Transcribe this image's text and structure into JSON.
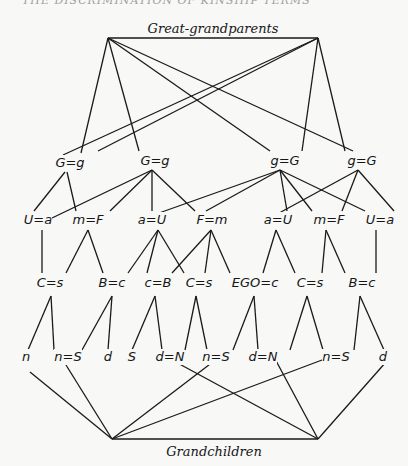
{
  "header_fragment": "THE DISCRIMINATION OF KINSHIP TERMS",
  "top_label": "Great-grandparents",
  "bottom_label": "Grandchildren",
  "rows": {
    "grandparents": [
      {
        "id": "g1",
        "label": "G=g",
        "x": 70,
        "y": 167
      },
      {
        "id": "g2",
        "label": "G=g",
        "x": 155,
        "y": 165
      },
      {
        "id": "g3",
        "label": "g=G",
        "x": 285,
        "y": 165
      },
      {
        "id": "g4",
        "label": "g=G",
        "x": 362,
        "y": 165
      }
    ],
    "parents": [
      {
        "id": "p1",
        "label": "U=a",
        "x": 38,
        "y": 224
      },
      {
        "id": "p2",
        "label": "m=F",
        "x": 88,
        "y": 224
      },
      {
        "id": "p3",
        "label": "a=U",
        "x": 152,
        "y": 224
      },
      {
        "id": "p4",
        "label": "F=m",
        "x": 212,
        "y": 224
      },
      {
        "id": "p5",
        "label": "a=U",
        "x": 278,
        "y": 224
      },
      {
        "id": "p6",
        "label": "m=F",
        "x": 329,
        "y": 224
      },
      {
        "id": "p7",
        "label": "U=a",
        "x": 380,
        "y": 224
      }
    ],
    "ego_generation": [
      {
        "id": "e1",
        "label": "C=s",
        "x": 50,
        "y": 287
      },
      {
        "id": "e2",
        "label": "B=c",
        "x": 112,
        "y": 287
      },
      {
        "id": "e3",
        "label": "c=B",
        "x": 158,
        "y": 287
      },
      {
        "id": "e4",
        "label": "C=s",
        "x": 199,
        "y": 287
      },
      {
        "id": "e5",
        "label": "EGO=c",
        "x": 255,
        "y": 287
      },
      {
        "id": "e6",
        "label": "C=s",
        "x": 310,
        "y": 287
      },
      {
        "id": "e7",
        "label": "B=c",
        "x": 362,
        "y": 287
      }
    ],
    "children": [
      {
        "id": "c1",
        "label": "n",
        "x": 26,
        "y": 361
      },
      {
        "id": "c2",
        "label": "n=S",
        "x": 68,
        "y": 361
      },
      {
        "id": "c3",
        "label": "d",
        "x": 108,
        "y": 361
      },
      {
        "id": "c4",
        "label": "S",
        "x": 132,
        "y": 361
      },
      {
        "id": "c5",
        "label": "d=N",
        "x": 170,
        "y": 361
      },
      {
        "id": "c6",
        "label": "n=S",
        "x": 216,
        "y": 361
      },
      {
        "id": "c7",
        "label": "d=N",
        "x": 263,
        "y": 361
      },
      {
        "id": "c8",
        "label": "n=S",
        "x": 336,
        "y": 361
      },
      {
        "id": "c9",
        "label": "d",
        "x": 383,
        "y": 361
      }
    ]
  },
  "edges": {
    "top_left_apex": [
      108,
      38
    ],
    "top_right_apex": [
      318,
      38
    ],
    "bottom_left_apex": [
      112,
      439
    ],
    "bottom_right_apex": [
      318,
      439
    ],
    "top_left_to": [
      [
        81,
        153
      ],
      [
        139,
        151
      ],
      [
        270,
        151
      ],
      [
        353,
        151
      ]
    ],
    "top_right_to": [
      [
        63,
        155
      ],
      [
        98,
        151
      ],
      [
        302,
        151
      ],
      [
        345,
        151
      ]
    ],
    "g_to_p": [
      [
        [
          65,
          172
        ],
        [
          34,
          211
        ]
      ],
      [
        [
          67,
          172
        ],
        [
          76,
          211
        ]
      ],
      [
        [
          152,
          170
        ],
        [
          52,
          218
        ]
      ],
      [
        [
          152,
          170
        ],
        [
          110,
          211
        ]
      ],
      [
        [
          152,
          170
        ],
        [
          152,
          211
        ]
      ],
      [
        [
          152,
          170
        ],
        [
          195,
          211
        ]
      ],
      [
        [
          280,
          170
        ],
        [
          145,
          218
        ]
      ],
      [
        [
          280,
          170
        ],
        [
          206,
          211
        ]
      ],
      [
        [
          280,
          170
        ],
        [
          287,
          211
        ]
      ],
      [
        [
          280,
          170
        ],
        [
          312,
          211
        ]
      ],
      [
        [
          280,
          170
        ],
        [
          365,
          211
        ]
      ],
      [
        [
          358,
          170
        ],
        [
          270,
          218
        ]
      ],
      [
        [
          358,
          170
        ],
        [
          342,
          211
        ]
      ],
      [
        [
          358,
          170
        ],
        [
          394,
          211
        ]
      ]
    ],
    "p_to_e": [
      [
        [
          42,
          230
        ],
        [
          42,
          273
        ]
      ],
      [
        [
          88,
          230
        ],
        [
          66,
          273
        ]
      ],
      [
        [
          88,
          230
        ],
        [
          103,
          273
        ]
      ],
      [
        [
          158,
          230
        ],
        [
          128,
          273
        ]
      ],
      [
        [
          158,
          230
        ],
        [
          147,
          273
        ]
      ],
      [
        [
          158,
          230
        ],
        [
          184,
          273
        ]
      ],
      [
        [
          211,
          230
        ],
        [
          172,
          273
        ]
      ],
      [
        [
          211,
          230
        ],
        [
          205,
          273
        ]
      ],
      [
        [
          211,
          230
        ],
        [
          230,
          273
        ]
      ],
      [
        [
          276,
          230
        ],
        [
          263,
          273
        ]
      ],
      [
        [
          276,
          230
        ],
        [
          295,
          273
        ]
      ],
      [
        [
          326,
          230
        ],
        [
          322,
          273
        ]
      ],
      [
        [
          326,
          230
        ],
        [
          345,
          273
        ]
      ],
      [
        [
          376,
          230
        ],
        [
          376,
          273
        ]
      ]
    ],
    "e_to_c": [
      [
        [
          51,
          296
        ],
        [
          28,
          350
        ]
      ],
      [
        [
          51,
          296
        ],
        [
          54,
          350
        ]
      ],
      [
        [
          112,
          296
        ],
        [
          82,
          350
        ]
      ],
      [
        [
          112,
          296
        ],
        [
          108,
          350
        ]
      ],
      [
        [
          155,
          296
        ],
        [
          132,
          350
        ]
      ],
      [
        [
          155,
          296
        ],
        [
          162,
          350
        ]
      ],
      [
        [
          196,
          296
        ],
        [
          185,
          350
        ]
      ],
      [
        [
          196,
          296
        ],
        [
          207,
          350
        ]
      ],
      [
        [
          254,
          296
        ],
        [
          233,
          350
        ]
      ],
      [
        [
          254,
          296
        ],
        [
          258,
          350
        ]
      ],
      [
        [
          307,
          296
        ],
        [
          290,
          350
        ]
      ],
      [
        [
          307,
          296
        ],
        [
          323,
          350
        ]
      ],
      [
        [
          360,
          296
        ],
        [
          354,
          350
        ]
      ],
      [
        [
          360,
          296
        ],
        [
          384,
          350
        ]
      ]
    ],
    "c_to_bottom_left": [
      [
        30,
        372
      ],
      [
        66,
        365
      ],
      [
        218,
        358
      ],
      [
        330,
        357
      ]
    ],
    "c_to_bottom_right": [
      [
        172,
        360
      ],
      [
        274,
        357
      ],
      [
        386,
        362
      ]
    ]
  }
}
